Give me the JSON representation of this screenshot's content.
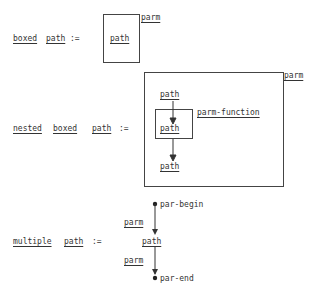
{
  "boxed": {
    "lhs_word1": "boxed",
    "lhs_word2": "path",
    "assign": ":=",
    "inner": "path",
    "label": "parm"
  },
  "nested": {
    "lhs_word1": "nested",
    "lhs_word2": "boxed",
    "lhs_word3": "path",
    "assign": ":=",
    "outer_label": "parm",
    "top_path": "path",
    "mid_path": "path",
    "bottom_path": "path",
    "inner_label": "parm-function"
  },
  "multiple": {
    "lhs_word1": "multiple",
    "lhs_word2": "path",
    "assign": ":=",
    "begin": "par-begin",
    "parm1": "parm",
    "path": "path",
    "parm2": "parm",
    "end": "par-end"
  }
}
